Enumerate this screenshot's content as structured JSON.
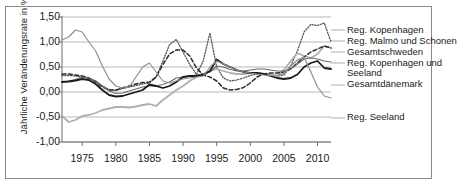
{
  "chart_data": {
    "type": "line",
    "title": "",
    "xlabel": "",
    "ylabel": "Jährliche Veränderungsrate in %",
    "xlim": [
      1972,
      2012
    ],
    "ylim": [
      -1.0,
      1.5
    ],
    "yticks": [
      "-1,00",
      "-0,50",
      "0,00",
      "0,50",
      "1,00",
      "1,50"
    ],
    "ytick_values": [
      -1.0,
      -0.5,
      0.0,
      0.5,
      1.0,
      1.5
    ],
    "xticks": [
      "1975",
      "1980",
      "1985",
      "1990",
      "1995",
      "2000",
      "2005",
      "2010"
    ],
    "xtick_values": [
      1975,
      1980,
      1985,
      1990,
      1995,
      2000,
      2005,
      2010
    ],
    "grid": true,
    "legend_position": "right",
    "x": [
      1972,
      1973,
      1974,
      1975,
      1976,
      1977,
      1978,
      1979,
      1980,
      1981,
      1982,
      1983,
      1984,
      1985,
      1986,
      1987,
      1988,
      1989,
      1990,
      1991,
      1992,
      1993,
      1994,
      1995,
      1996,
      1997,
      1998,
      1999,
      2000,
      2001,
      2002,
      2003,
      2004,
      2005,
      2006,
      2007,
      2008,
      2009,
      2010,
      2011,
      2012
    ],
    "series": [
      {
        "name": "Reg. Kopenhagen",
        "style": "dotted",
        "color": "#555555",
        "width": 1.3,
        "values": [
          0.33,
          0.33,
          0.32,
          0.3,
          0.28,
          0.22,
          0.12,
          0.05,
          0.03,
          0.07,
          0.1,
          0.13,
          0.16,
          0.18,
          0.3,
          0.62,
          0.95,
          1.05,
          0.8,
          0.55,
          0.35,
          0.62,
          1.18,
          0.5,
          0.28,
          0.22,
          0.24,
          0.28,
          0.33,
          0.36,
          0.36,
          0.34,
          0.32,
          0.34,
          0.52,
          0.82,
          1.2,
          1.35,
          1.33,
          1.38,
          1.0
        ]
      },
      {
        "name": "Reg. Malmö und Schonen",
        "style": "solid",
        "color": "#b0b0b0",
        "width": 1.8,
        "values": [
          -0.48,
          -0.6,
          -0.56,
          -0.48,
          -0.46,
          -0.42,
          -0.36,
          -0.33,
          -0.3,
          -0.3,
          -0.31,
          -0.29,
          -0.26,
          -0.24,
          -0.28,
          -0.16,
          -0.06,
          0.04,
          0.12,
          0.22,
          0.3,
          0.36,
          0.42,
          0.46,
          0.42,
          0.38,
          0.36,
          0.36,
          0.38,
          0.38,
          0.36,
          0.34,
          0.33,
          0.44,
          0.62,
          0.78,
          0.72,
          0.68,
          0.76,
          0.92,
          0.88
        ]
      },
      {
        "name": "Gesamtschweden",
        "style": "dashed",
        "color": "#2b2b2b",
        "width": 1.5,
        "values": [
          0.36,
          0.36,
          0.34,
          0.32,
          0.28,
          0.2,
          0.1,
          0.04,
          0.04,
          0.08,
          0.12,
          0.16,
          0.19,
          0.2,
          0.3,
          0.55,
          0.76,
          0.84,
          0.84,
          0.72,
          0.48,
          0.34,
          0.3,
          0.22,
          0.08,
          0.04,
          0.05,
          0.09,
          0.18,
          0.3,
          0.36,
          0.38,
          0.38,
          0.4,
          0.46,
          0.58,
          0.7,
          0.8,
          0.86,
          0.92,
          0.88
        ]
      },
      {
        "name": "Reg. Kopenhagen und Seeland",
        "style": "solid",
        "color": "#6a6a6a",
        "width": 1.2,
        "values": [
          0.2,
          0.22,
          0.25,
          0.3,
          0.28,
          0.22,
          0.12,
          0.02,
          -0.03,
          -0.02,
          0.02,
          0.06,
          0.1,
          0.12,
          0.12,
          0.15,
          0.2,
          0.28,
          0.3,
          0.32,
          0.34,
          0.36,
          0.4,
          0.52,
          0.5,
          0.45,
          0.42,
          0.42,
          0.44,
          0.46,
          0.46,
          0.44,
          0.42,
          0.42,
          0.46,
          0.56,
          0.66,
          0.68,
          0.66,
          0.62,
          0.6
        ]
      },
      {
        "name": "Gesamtdänemark",
        "style": "solid",
        "color": "#1a1a1a",
        "width": 1.8,
        "values": [
          0.2,
          0.21,
          0.23,
          0.26,
          0.24,
          0.16,
          0.04,
          -0.06,
          -0.09,
          -0.08,
          -0.04,
          0.0,
          0.04,
          0.15,
          0.12,
          0.08,
          0.12,
          0.2,
          0.3,
          0.32,
          0.32,
          0.34,
          0.42,
          0.65,
          0.56,
          0.5,
          0.44,
          0.4,
          0.38,
          0.38,
          0.36,
          0.32,
          0.28,
          0.26,
          0.28,
          0.35,
          0.5,
          0.58,
          0.62,
          0.48,
          0.46
        ]
      },
      {
        "name": "Reg. Seeland",
        "style": "solid",
        "color": "#8f8f8f",
        "width": 1.2,
        "values": [
          1.04,
          1.1,
          1.24,
          1.2,
          1.0,
          0.82,
          0.52,
          0.26,
          0.12,
          0.08,
          0.1,
          0.3,
          0.5,
          0.58,
          0.4,
          0.22,
          0.18,
          0.22,
          0.26,
          0.28,
          0.3,
          0.32,
          0.5,
          0.62,
          0.56,
          0.5,
          0.44,
          0.4,
          0.38,
          0.36,
          0.34,
          0.33,
          0.32,
          0.38,
          0.52,
          0.64,
          0.7,
          0.4,
          0.1,
          -0.08,
          -0.12
        ]
      }
    ],
    "legend_entries": [
      {
        "label": "Reg. Kopenhagen"
      },
      {
        "label": "Reg. Malmö und Schonen"
      },
      {
        "label": "Gesamtschweden"
      },
      {
        "label": "Reg. Kopenhagen und"
      },
      {
        "label": "Seeland"
      },
      {
        "label": "Gesamtdänemark"
      },
      {
        "label": "Reg. Seeland"
      }
    ]
  }
}
